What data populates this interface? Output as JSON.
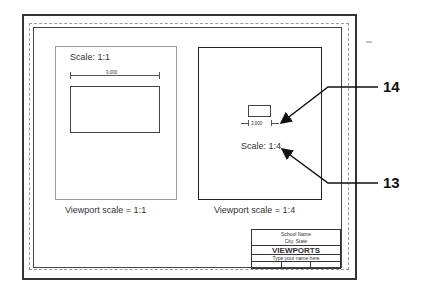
{
  "drawing": {
    "left_viewport": {
      "scale_label": "Scale: 1:1",
      "dimension": "3.000",
      "caption": "Viewport scale = 1:1"
    },
    "right_viewport": {
      "scale_label": "Scale: 1:4",
      "dimension": "3.000",
      "caption": "Viewport scale = 1:4"
    },
    "callouts": [
      {
        "label": "14",
        "points_to": "dimension text"
      },
      {
        "label": "13",
        "points_to": "scale label"
      }
    ],
    "title_block": {
      "school_name": "School Name",
      "city_state": "City, State",
      "title": "VIEWPORTS",
      "name_field": "Type your name here"
    }
  }
}
